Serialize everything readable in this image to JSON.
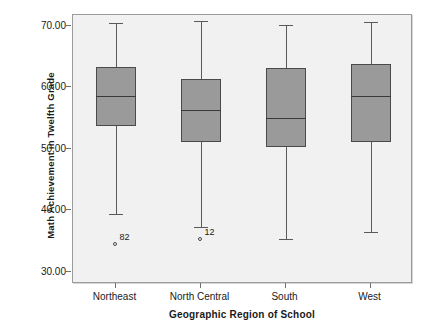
{
  "chart_data": {
    "type": "box",
    "title": "",
    "xlabel": "Geographic Region of School",
    "ylabel": "Math Achievement in Twelfth Grade",
    "categories": [
      "Northeast",
      "North Central",
      "South",
      "West"
    ],
    "ylim": [
      28.0,
      71.8
    ],
    "yticks": [
      30.0,
      40.0,
      50.0,
      60.0,
      70.0
    ],
    "ytick_labels": [
      "30.00",
      "40.00",
      "50.00",
      "60.00",
      "70.00"
    ],
    "grid": false,
    "legend": "none",
    "boxes": [
      {
        "category": "Northeast",
        "whisker_low": 39.4,
        "q1": 53.7,
        "median": 58.6,
        "q3": 63.3,
        "whisker_high": 70.5,
        "outliers": [
          {
            "value": 34.4,
            "label": "82"
          }
        ]
      },
      {
        "category": "North Central",
        "whisker_low": 37.2,
        "q1": 51.2,
        "median": 56.3,
        "q3": 61.4,
        "whisker_high": 70.8,
        "outliers": [
          {
            "value": 35.1,
            "label": "12"
          }
        ]
      },
      {
        "category": "South",
        "whisker_low": 35.3,
        "q1": 50.3,
        "median": 55.0,
        "q3": 63.1,
        "whisker_high": 70.2,
        "outliers": []
      },
      {
        "category": "West",
        "whisker_low": 36.4,
        "q1": 51.1,
        "median": 58.6,
        "q3": 63.8,
        "whisker_high": 70.6,
        "outliers": []
      }
    ],
    "colors": {
      "box_fill": "#9a9a9a",
      "box_border": "#4a4a4a",
      "whisker": "#5a5a5a",
      "median": "#3a3a3a",
      "plot_background": "#f1f1f1",
      "frame": "#9b9b9b",
      "text": "#1a1a1a"
    }
  }
}
